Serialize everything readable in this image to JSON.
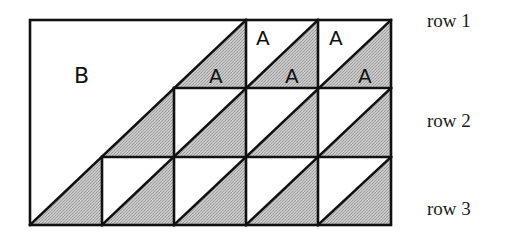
{
  "diagram": {
    "title": "",
    "grid": {
      "columns": 5,
      "rows": 3
    },
    "colors": {
      "line": "#111111",
      "shade": "#bdbdbd",
      "background": "#ffffff"
    },
    "region_labels": {
      "big_region": "B",
      "triangle_label": "A"
    },
    "row_labels": [
      "row 1",
      "row 2",
      "row 3"
    ],
    "a_labels": [
      {
        "text": "A",
        "cell": "row1-col3-lower"
      },
      {
        "text": "A",
        "cell": "row1-col4-upper"
      },
      {
        "text": "A",
        "cell": "row1-col4-lower"
      },
      {
        "text": "A",
        "cell": "row1-col5-upper"
      },
      {
        "text": "A",
        "cell": "row1-col5-lower"
      }
    ]
  }
}
